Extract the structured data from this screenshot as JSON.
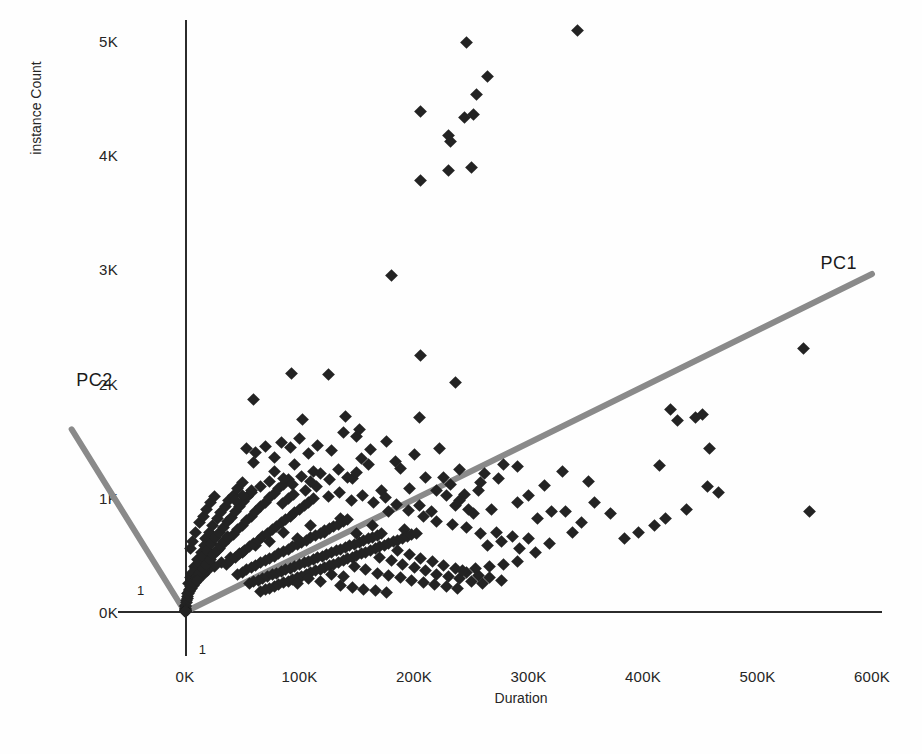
{
  "chart_data": {
    "type": "scatter",
    "title": "",
    "xlabel": "Duration",
    "ylabel": "instance Count",
    "xlim": [
      -30000,
      620000
    ],
    "ylim": [
      -250,
      5300
    ],
    "grid": false,
    "legend_position": "none",
    "x_tick_labels": [
      "0K",
      "100K",
      "200K",
      "300K",
      "400K",
      "500K",
      "600K"
    ],
    "x_tick_values": [
      0,
      100000,
      200000,
      300000,
      400000,
      500000,
      600000
    ],
    "y_tick_labels": [
      "0K",
      "1K",
      "2K",
      "3K",
      "4K",
      "5K"
    ],
    "y_tick_values": [
      0,
      1000,
      2000,
      3000,
      4000,
      5000
    ],
    "marker_shape": "diamond",
    "marker_color": "#232323",
    "annotations": [
      {
        "name": "pc1-vector-label",
        "text": "PC1",
        "x": 555000,
        "y": 3050
      },
      {
        "name": "pc2-vector-label",
        "text": "PC2",
        "x": -95000,
        "y": 2020
      },
      {
        "name": "x-unit-tick",
        "text": "1",
        "x": 12000,
        "y": -330
      },
      {
        "name": "y-unit-tick",
        "text": "1",
        "x": -42000,
        "y": 180
      }
    ],
    "vectors": [
      {
        "name": "PC1",
        "x0": 0,
        "y0": 0,
        "x1": 600000,
        "y1": 2960
      },
      {
        "name": "PC2",
        "x0": 0,
        "y0": 0,
        "x1": -99000,
        "y1": 1600
      }
    ],
    "points": [
      [
        206000,
        4380
      ],
      [
        230000,
        4170
      ],
      [
        232000,
        4120
      ],
      [
        244000,
        4330
      ],
      [
        252000,
        4360
      ],
      [
        246000,
        4990
      ],
      [
        264000,
        4690
      ],
      [
        255000,
        4530
      ],
      [
        230000,
        3870
      ],
      [
        250000,
        3890
      ],
      [
        206000,
        3780
      ],
      [
        343000,
        5090
      ],
      [
        180000,
        2950
      ],
      [
        206000,
        2250
      ],
      [
        236000,
        2010
      ],
      [
        125000,
        2080
      ],
      [
        93000,
        2090
      ],
      [
        60000,
        1860
      ],
      [
        103000,
        1690
      ],
      [
        140000,
        1710
      ],
      [
        150000,
        1540
      ],
      [
        205000,
        1700
      ],
      [
        222000,
        1430
      ],
      [
        60000,
        1310
      ],
      [
        78000,
        1350
      ],
      [
        96000,
        1290
      ],
      [
        112000,
        1230
      ],
      [
        128000,
        1410
      ],
      [
        146000,
        1170
      ],
      [
        160000,
        1290
      ],
      [
        172000,
        1060
      ],
      [
        188000,
        1260
      ],
      [
        196000,
        1080
      ],
      [
        210000,
        1180
      ],
      [
        232000,
        1120
      ],
      [
        244000,
        1030
      ],
      [
        262000,
        1210
      ],
      [
        278000,
        1290
      ],
      [
        300000,
        1020
      ],
      [
        314000,
        1110
      ],
      [
        330000,
        1230
      ],
      [
        352000,
        1140
      ],
      [
        300000,
        640
      ],
      [
        320000,
        880
      ],
      [
        338000,
        700
      ],
      [
        414000,
        1280
      ],
      [
        430000,
        1680
      ],
      [
        446000,
        1700
      ],
      [
        452000,
        1730
      ],
      [
        458000,
        1430
      ],
      [
        424000,
        1770
      ],
      [
        466000,
        1050
      ],
      [
        456000,
        1100
      ],
      [
        540000,
        2310
      ],
      [
        545000,
        880
      ],
      [
        290000,
        960
      ],
      [
        268000,
        900
      ],
      [
        252000,
        860
      ],
      [
        236000,
        930
      ],
      [
        220000,
        790
      ],
      [
        208000,
        840
      ],
      [
        192000,
        720
      ],
      [
        178000,
        880
      ],
      [
        164000,
        760
      ],
      [
        150000,
        690
      ],
      [
        136000,
        820
      ],
      [
        122000,
        700
      ],
      [
        110000,
        760
      ],
      [
        98000,
        640
      ],
      [
        86000,
        700
      ],
      [
        74000,
        620
      ],
      [
        62000,
        580
      ],
      [
        50000,
        520
      ],
      [
        40000,
        480
      ],
      [
        32000,
        430
      ],
      [
        26000,
        400
      ],
      [
        20000,
        360
      ],
      [
        16000,
        330
      ],
      [
        12000,
        290
      ],
      [
        9000,
        260
      ],
      [
        7000,
        230
      ],
      [
        5500,
        205
      ],
      [
        4200,
        180
      ],
      [
        3200,
        160
      ],
      [
        2400,
        140
      ],
      [
        1800,
        120
      ],
      [
        1300,
        100
      ],
      [
        900,
        80
      ],
      [
        600,
        60
      ],
      [
        400,
        45
      ],
      [
        250,
        32
      ],
      [
        150,
        22
      ],
      [
        90,
        15
      ],
      [
        50,
        10
      ],
      [
        30,
        6
      ],
      [
        20,
        4
      ],
      [
        12,
        3
      ],
      [
        8,
        2
      ],
      [
        5,
        1
      ],
      [
        3,
        1
      ],
      [
        4500,
        560
      ],
      [
        6800,
        620
      ],
      [
        9200,
        700
      ],
      [
        12500,
        780
      ],
      [
        15800,
        840
      ],
      [
        19200,
        900
      ],
      [
        22500,
        960
      ],
      [
        26000,
        1010
      ],
      [
        18000,
        640
      ],
      [
        21000,
        700
      ],
      [
        24000,
        760
      ],
      [
        28000,
        820
      ],
      [
        31000,
        870
      ],
      [
        35000,
        920
      ],
      [
        38000,
        980
      ],
      [
        42000,
        1020
      ],
      [
        46000,
        1080
      ],
      [
        50000,
        1130
      ],
      [
        26000,
        520
      ],
      [
        30000,
        560
      ],
      [
        34000,
        600
      ],
      [
        38000,
        640
      ],
      [
        42000,
        680
      ],
      [
        46000,
        720
      ],
      [
        50000,
        760
      ],
      [
        54000,
        800
      ],
      [
        58000,
        840
      ],
      [
        62000,
        880
      ],
      [
        66000,
        920
      ],
      [
        70000,
        960
      ],
      [
        74000,
        1000
      ],
      [
        78000,
        1040
      ],
      [
        82000,
        1080
      ],
      [
        86000,
        1120
      ],
      [
        90000,
        1160
      ],
      [
        36000,
        420
      ],
      [
        40000,
        450
      ],
      [
        44000,
        480
      ],
      [
        48000,
        510
      ],
      [
        52000,
        540
      ],
      [
        56000,
        570
      ],
      [
        60000,
        600
      ],
      [
        64000,
        630
      ],
      [
        68000,
        660
      ],
      [
        72000,
        690
      ],
      [
        76000,
        720
      ],
      [
        80000,
        750
      ],
      [
        84000,
        780
      ],
      [
        88000,
        810
      ],
      [
        92000,
        840
      ],
      [
        96000,
        870
      ],
      [
        100000,
        900
      ],
      [
        104000,
        930
      ],
      [
        108000,
        960
      ],
      [
        112000,
        990
      ],
      [
        46000,
        330
      ],
      [
        50000,
        350
      ],
      [
        54000,
        370
      ],
      [
        58000,
        390
      ],
      [
        62000,
        410
      ],
      [
        66000,
        430
      ],
      [
        70000,
        450
      ],
      [
        74000,
        470
      ],
      [
        78000,
        490
      ],
      [
        82000,
        510
      ],
      [
        86000,
        530
      ],
      [
        90000,
        550
      ],
      [
        94000,
        570
      ],
      [
        98000,
        590
      ],
      [
        102000,
        610
      ],
      [
        106000,
        630
      ],
      [
        110000,
        650
      ],
      [
        114000,
        670
      ],
      [
        118000,
        690
      ],
      [
        122000,
        710
      ],
      [
        126000,
        730
      ],
      [
        130000,
        750
      ],
      [
        134000,
        770
      ],
      [
        138000,
        790
      ],
      [
        142000,
        810
      ],
      [
        56000,
        250
      ],
      [
        60000,
        265
      ],
      [
        64000,
        280
      ],
      [
        68000,
        295
      ],
      [
        72000,
        310
      ],
      [
        76000,
        325
      ],
      [
        80000,
        340
      ],
      [
        84000,
        355
      ],
      [
        88000,
        370
      ],
      [
        92000,
        385
      ],
      [
        96000,
        400
      ],
      [
        100000,
        415
      ],
      [
        104000,
        430
      ],
      [
        108000,
        445
      ],
      [
        112000,
        460
      ],
      [
        116000,
        475
      ],
      [
        120000,
        490
      ],
      [
        124000,
        505
      ],
      [
        128000,
        520
      ],
      [
        132000,
        535
      ],
      [
        136000,
        550
      ],
      [
        140000,
        565
      ],
      [
        144000,
        580
      ],
      [
        148000,
        595
      ],
      [
        152000,
        610
      ],
      [
        156000,
        625
      ],
      [
        160000,
        640
      ],
      [
        164000,
        655
      ],
      [
        168000,
        670
      ],
      [
        172000,
        685
      ],
      [
        66000,
        180
      ],
      [
        70000,
        195
      ],
      [
        74000,
        210
      ],
      [
        78000,
        225
      ],
      [
        82000,
        240
      ],
      [
        86000,
        255
      ],
      [
        90000,
        270
      ],
      [
        94000,
        285
      ],
      [
        98000,
        300
      ],
      [
        102000,
        315
      ],
      [
        106000,
        330
      ],
      [
        110000,
        345
      ],
      [
        114000,
        360
      ],
      [
        118000,
        375
      ],
      [
        122000,
        390
      ],
      [
        126000,
        405
      ],
      [
        130000,
        420
      ],
      [
        134000,
        435
      ],
      [
        138000,
        450
      ],
      [
        142000,
        465
      ],
      [
        146000,
        480
      ],
      [
        150000,
        495
      ],
      [
        154000,
        510
      ],
      [
        158000,
        525
      ],
      [
        162000,
        540
      ],
      [
        166000,
        555
      ],
      [
        170000,
        570
      ],
      [
        174000,
        585
      ],
      [
        178000,
        600
      ],
      [
        182000,
        615
      ],
      [
        186000,
        630
      ],
      [
        190000,
        645
      ],
      [
        194000,
        660
      ],
      [
        198000,
        675
      ],
      [
        202000,
        690
      ],
      [
        8000,
        400
      ],
      [
        11000,
        460
      ],
      [
        14000,
        520
      ],
      [
        17000,
        580
      ],
      [
        6000,
        340
      ],
      [
        9500,
        380
      ],
      [
        13000,
        430
      ],
      [
        16500,
        490
      ],
      [
        20000,
        540
      ],
      [
        23500,
        600
      ],
      [
        27000,
        650
      ],
      [
        30500,
        700
      ],
      [
        34000,
        740
      ],
      [
        37500,
        790
      ],
      [
        41000,
        830
      ],
      [
        44500,
        880
      ],
      [
        48000,
        920
      ],
      [
        51500,
        970
      ],
      [
        55000,
        1010
      ],
      [
        58500,
        1050
      ],
      [
        3000,
        250
      ],
      [
        5000,
        300
      ],
      [
        7000,
        350
      ],
      [
        4000,
        200
      ],
      [
        6000,
        270
      ],
      [
        10000,
        300
      ],
      [
        13000,
        340
      ],
      [
        16000,
        380
      ],
      [
        19000,
        420
      ],
      [
        22000,
        460
      ],
      [
        25000,
        500
      ],
      [
        28000,
        540
      ],
      [
        31000,
        580
      ],
      [
        34000,
        620
      ],
      [
        37000,
        660
      ],
      [
        2000,
        160
      ],
      [
        3500,
        190
      ],
      [
        5200,
        220
      ],
      [
        7500,
        260
      ],
      [
        10500,
        280
      ],
      [
        90000,
        990
      ],
      [
        95000,
        1030
      ],
      [
        85000,
        950
      ],
      [
        105000,
        1060
      ],
      [
        115000,
        1100
      ],
      [
        125000,
        1010
      ],
      [
        135000,
        1050
      ],
      [
        145000,
        980
      ],
      [
        155000,
        1020
      ],
      [
        165000,
        960
      ],
      [
        175000,
        1000
      ],
      [
        185000,
        940
      ],
      [
        195000,
        890
      ],
      [
        205000,
        930
      ],
      [
        215000,
        880
      ],
      [
        74000,
        1140
      ],
      [
        66000,
        1100
      ],
      [
        58000,
        1060
      ],
      [
        50000,
        1020
      ],
      [
        44000,
        980
      ],
      [
        150000,
        1220
      ],
      [
        142000,
        1180
      ],
      [
        134000,
        1250
      ],
      [
        126000,
        1160
      ],
      [
        118000,
        1210
      ],
      [
        110000,
        1140
      ],
      [
        102000,
        1190
      ],
      [
        94000,
        1120
      ],
      [
        86000,
        1170
      ],
      [
        78000,
        1230
      ],
      [
        220000,
        1060
      ],
      [
        228000,
        1020
      ],
      [
        240000,
        980
      ],
      [
        248000,
        900
      ],
      [
        256000,
        1060
      ],
      [
        186000,
        540
      ],
      [
        196000,
        500
      ],
      [
        206000,
        470
      ],
      [
        216000,
        440
      ],
      [
        226000,
        410
      ],
      [
        236000,
        380
      ],
      [
        246000,
        350
      ],
      [
        256000,
        320
      ],
      [
        266000,
        300
      ],
      [
        276000,
        280
      ],
      [
        170000,
        480
      ],
      [
        180000,
        450
      ],
      [
        190000,
        420
      ],
      [
        200000,
        390
      ],
      [
        210000,
        360
      ],
      [
        220000,
        330
      ],
      [
        230000,
        310
      ],
      [
        240000,
        290
      ],
      [
        250000,
        270
      ],
      [
        260000,
        250
      ],
      [
        148000,
        400
      ],
      [
        158000,
        370
      ],
      [
        168000,
        340
      ],
      [
        178000,
        320
      ],
      [
        188000,
        300
      ],
      [
        198000,
        280
      ],
      [
        208000,
        260
      ],
      [
        218000,
        240
      ],
      [
        228000,
        225
      ],
      [
        238000,
        210
      ],
      [
        128000,
        330
      ],
      [
        138000,
        310
      ],
      [
        108000,
        290
      ],
      [
        118000,
        270
      ],
      [
        98000,
        250
      ],
      [
        272000,
        700
      ],
      [
        286000,
        660
      ],
      [
        246000,
        740
      ],
      [
        258000,
        690
      ],
      [
        234000,
        770
      ],
      [
        292000,
        560
      ],
      [
        306000,
        520
      ],
      [
        318000,
        600
      ],
      [
        276000,
        620
      ],
      [
        264000,
        580
      ],
      [
        290000,
        440
      ],
      [
        278000,
        420
      ],
      [
        266000,
        400
      ],
      [
        254000,
        380
      ],
      [
        242000,
        360
      ],
      [
        156000,
        200
      ],
      [
        166000,
        185
      ],
      [
        176000,
        170
      ],
      [
        146000,
        215
      ],
      [
        136000,
        230
      ],
      [
        200000,
        1380
      ],
      [
        184000,
        1320
      ],
      [
        176000,
        1490
      ],
      [
        162000,
        1420
      ],
      [
        154000,
        1340
      ],
      [
        116000,
        1460
      ],
      [
        108000,
        1390
      ],
      [
        100000,
        1520
      ],
      [
        92000,
        1440
      ],
      [
        84000,
        1480
      ],
      [
        70000,
        1450
      ],
      [
        62000,
        1400
      ],
      [
        54000,
        1430
      ],
      [
        152000,
        1600
      ],
      [
        138000,
        1570
      ],
      [
        290000,
        1270
      ],
      [
        274000,
        1170
      ],
      [
        258000,
        1130
      ],
      [
        240000,
        1250
      ],
      [
        226000,
        1180
      ],
      [
        332000,
        880
      ],
      [
        346000,
        780
      ],
      [
        358000,
        960
      ],
      [
        372000,
        860
      ],
      [
        308000,
        820
      ],
      [
        396000,
        700
      ],
      [
        410000,
        760
      ],
      [
        384000,
        640
      ],
      [
        420000,
        820
      ],
      [
        438000,
        900
      ]
    ]
  }
}
